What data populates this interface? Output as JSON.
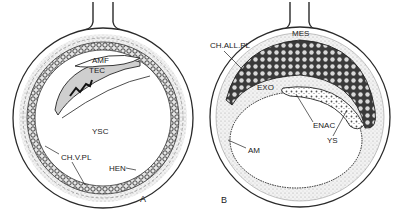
{
  "figure": {
    "panels": [
      {
        "id": "A",
        "label": "A",
        "annotations": {
          "amf": "AMF",
          "tec": "TEC",
          "ysc": "YSC",
          "chvpl": "CH.V.PL",
          "hen": "HEN"
        }
      },
      {
        "id": "B",
        "label": "B",
        "annotations": {
          "mes": "MES",
          "challpl": "CH.ALL.PL",
          "exo": "EXO",
          "enac": "ENAC",
          "am": "AM",
          "ys": "YS"
        }
      }
    ],
    "colors": {
      "ink": "#2a2a2a",
      "stipple": "#c8c8c8",
      "dark_cells": "#3a3a3a",
      "background": "#ffffff"
    }
  }
}
